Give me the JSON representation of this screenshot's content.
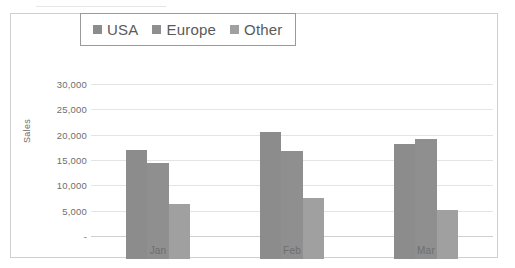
{
  "chart_data": {
    "type": "bar",
    "title": "",
    "subtitle": "",
    "xlabel": "",
    "ylabel": "Sales",
    "categories": [
      "Jan",
      "Feb",
      "Mar"
    ],
    "series": [
      {
        "name": "USA",
        "values": [
          21500,
          25000,
          22700
        ],
        "color": "#8c8c8c"
      },
      {
        "name": "Europe",
        "values": [
          19000,
          21300,
          23700
        ],
        "color": "#8f8f8f"
      },
      {
        "name": "Other",
        "values": [
          10800,
          12000,
          9700
        ],
        "color": "#a0a0a0"
      }
    ],
    "ylim": [
      0,
      30000
    ],
    "y_ticks": [
      0,
      5000,
      10000,
      15000,
      20000,
      25000,
      30000
    ],
    "y_tick_labels": [
      "-",
      "5,000",
      "10,000",
      "15,000",
      "20,000",
      "25,000",
      "30,000"
    ],
    "grid": true,
    "grid_axis": "y",
    "legend_position": "top-center",
    "bar_gap": 0,
    "group_gap": 0.52
  },
  "legend": {
    "items": [
      {
        "label": "USA",
        "swatch_name": "legend-swatch-usa",
        "color": "#8c8c8c"
      },
      {
        "label": "Europe",
        "swatch_name": "legend-swatch-europe",
        "color": "#8f8f8f"
      },
      {
        "label": "Other",
        "swatch_name": "legend-swatch-other",
        "color": "#a0a0a0"
      }
    ]
  },
  "style": {
    "plot_background": "#ffffff",
    "frame_border": "#cfcfcf",
    "gridline_color": "#e4e4e4",
    "baseline_color": "#d0d0d0",
    "text_color": "#6e6e6e",
    "legend_border": "#9a9a9a"
  }
}
